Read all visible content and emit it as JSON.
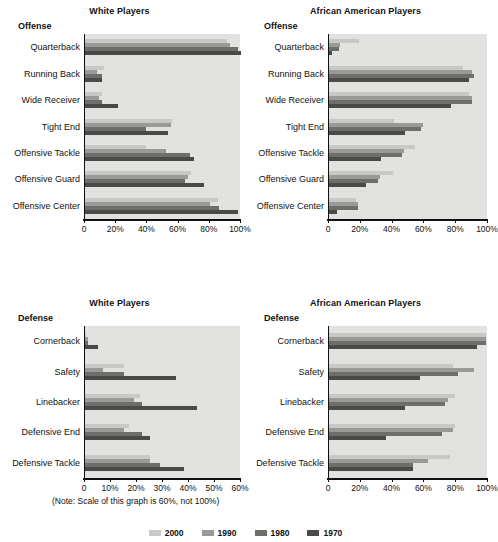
{
  "figure": {
    "legend": {
      "items": [
        {
          "label": "2000",
          "color": "#c9c9c7"
        },
        {
          "label": "1990",
          "color": "#9a9a98"
        },
        {
          "label": "1980",
          "color": "#6e6e6c"
        },
        {
          "label": "1970",
          "color": "#4a4a48"
        }
      ]
    },
    "series_colors": [
      "#c9c9c7",
      "#9a9a98",
      "#6e6e6c",
      "#4a4a48"
    ],
    "plot_background": "#e3e3e1",
    "axis_color": "#111111",
    "note": "(Note: Scale of this graph is 60%, not 100%)"
  },
  "chart_data": [
    {
      "id": "offense-white",
      "type": "bar",
      "orientation": "horizontal",
      "title": "White Players",
      "subtitle": "Offense",
      "xlabel": "",
      "ylabel": "",
      "xlim": [
        0,
        100
      ],
      "grid": false,
      "legend_position": "bottom",
      "tick_values": [
        0,
        20,
        40,
        60,
        80,
        100
      ],
      "tick_labels": [
        "0",
        "20%",
        "40%",
        "60%",
        "80%",
        "100%"
      ],
      "categories": [
        "Quarterback",
        "Running Back",
        "Wide Receiver",
        "Tight End",
        "Offensive Tackle",
        "Offensive Guard",
        "Offensive Center"
      ],
      "series": [
        {
          "name": "2000",
          "values": [
            91,
            12,
            11,
            56,
            39,
            68,
            85
          ]
        },
        {
          "name": "1990",
          "values": [
            93,
            8,
            9,
            55,
            52,
            66,
            80
          ]
        },
        {
          "name": "1980",
          "values": [
            98,
            11,
            11,
            39,
            67,
            64,
            86
          ]
        },
        {
          "name": "1970",
          "values": [
            100,
            11,
            21,
            53,
            70,
            76,
            98
          ]
        }
      ]
    },
    {
      "id": "offense-african-american",
      "type": "bar",
      "orientation": "horizontal",
      "title": "African American Players",
      "subtitle": "Offense",
      "xlabel": "",
      "ylabel": "",
      "xlim": [
        0,
        100
      ],
      "grid": false,
      "legend_position": "bottom",
      "tick_values": [
        0,
        20,
        40,
        60,
        80,
        100
      ],
      "tick_labels": [
        "0",
        "20%",
        "40%",
        "60%",
        "80%",
        "100%"
      ],
      "categories": [
        "Quarterback",
        "Running Back",
        "Wide Receiver",
        "Tight End",
        "Offensive Tackle",
        "Offensive Guard",
        "Offensive Center"
      ],
      "series": [
        {
          "name": "2000",
          "values": [
            19,
            84,
            88,
            41,
            54,
            40,
            17
          ]
        },
        {
          "name": "1990",
          "values": [
            7,
            90,
            90,
            59,
            47,
            32,
            18
          ]
        },
        {
          "name": "1980",
          "values": [
            6,
            91,
            90,
            58,
            46,
            31,
            18
          ]
        },
        {
          "name": "1970",
          "values": [
            2,
            88,
            77,
            48,
            33,
            23,
            5
          ]
        }
      ]
    },
    {
      "id": "defense-white",
      "type": "bar",
      "orientation": "horizontal",
      "title": "White Players",
      "subtitle": "Defense",
      "xlabel": "",
      "ylabel": "",
      "xlim": [
        0,
        60
      ],
      "grid": false,
      "legend_position": "bottom",
      "note": "(Note: Scale of this graph is 60%, not 100%)",
      "tick_values": [
        0,
        10,
        20,
        30,
        40,
        50,
        60
      ],
      "tick_labels": [
        "0",
        "10%",
        "20%",
        "30%",
        "40%",
        "50%",
        "60%"
      ],
      "categories": [
        "Cornerback",
        "Safety",
        "Linebacker",
        "Defensive End",
        "Defensive Tackle"
      ],
      "series": [
        {
          "name": "2000",
          "values": [
            0.5,
            15,
            21,
            17,
            25
          ]
        },
        {
          "name": "1990",
          "values": [
            1,
            7,
            19,
            15,
            25
          ]
        },
        {
          "name": "1980",
          "values": [
            1,
            15,
            22,
            22,
            29
          ]
        },
        {
          "name": "1970",
          "values": [
            5,
            35,
            43,
            25,
            38
          ]
        }
      ]
    },
    {
      "id": "defense-african-american",
      "type": "bar",
      "orientation": "horizontal",
      "title": "African American Players",
      "subtitle": "Defense",
      "xlabel": "",
      "ylabel": "",
      "xlim": [
        0,
        100
      ],
      "grid": false,
      "legend_position": "bottom",
      "tick_values": [
        0,
        20,
        40,
        60,
        80,
        100
      ],
      "tick_labels": [
        "0",
        "20%",
        "40%",
        "60%",
        "80%",
        "100%"
      ],
      "categories": [
        "Cornerback",
        "Safety",
        "Linebacker",
        "Defensive End",
        "Defensive Tackle"
      ],
      "series": [
        {
          "name": "2000",
          "values": [
            99,
            78,
            79,
            79,
            76
          ]
        },
        {
          "name": "1990",
          "values": [
            99,
            91,
            75,
            78,
            62
          ]
        },
        {
          "name": "1980",
          "values": [
            99,
            81,
            73,
            71,
            53
          ]
        },
        {
          "name": "1970",
          "values": [
            93,
            57,
            48,
            36,
            53
          ]
        }
      ]
    }
  ]
}
